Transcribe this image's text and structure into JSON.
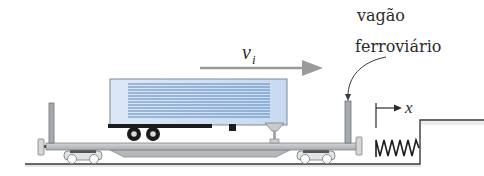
{
  "diagram": {
    "title": "",
    "labels": {
      "velocity": "v",
      "velocity_subscript": "i",
      "railcar_line1": "vagão",
      "railcar_line2": "ferroviário",
      "axis": "x"
    },
    "colors": {
      "trailer_fill": "#cfe0f3",
      "trailer_stripe": "#5b86bd",
      "metal": "#b9bcbf",
      "metal_dark": "#8a8d90",
      "arrow": "#999999",
      "ink": "#2b2b2b",
      "tire": "#1a1a1a"
    },
    "components": [
      "flatcar",
      "semi-trailer",
      "velocity-arrow",
      "spring-bumper",
      "x-axis-marker",
      "ground-with-step"
    ]
  }
}
